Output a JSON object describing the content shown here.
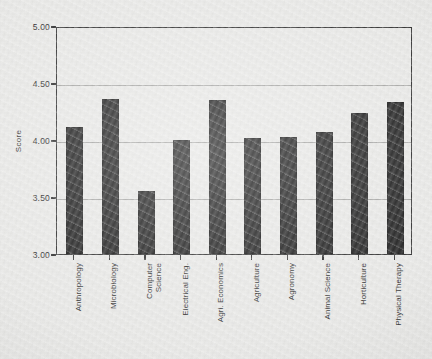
{
  "chart_data": {
    "type": "bar",
    "title": "",
    "xlabel": "",
    "ylabel": "Score",
    "ylim": [
      3.0,
      5.0
    ],
    "yticks": [
      "3.00",
      "3.50",
      "4.00",
      "4.50",
      "5.00"
    ],
    "ytick_values": [
      3.0,
      3.5,
      4.0,
      4.5,
      5.0
    ],
    "grid": true,
    "legend": false,
    "bar_color": "#1a1a1a",
    "categories": [
      "Anthropology",
      "Microbiology",
      "Computer\nScience",
      "Electrical Eng.",
      "Agri. Economics",
      "Agriculture",
      "Agronomy",
      "Animal Science",
      "Horticulture",
      "Physical Therapy"
    ],
    "values": [
      4.11,
      4.36,
      3.55,
      4.0,
      4.35,
      4.02,
      4.03,
      4.07,
      4.24,
      4.33
    ]
  },
  "figure": {
    "background_color": "#e8e8e6",
    "axis_color": "#2b2b2b",
    "grid_color": "#9a9a98"
  }
}
